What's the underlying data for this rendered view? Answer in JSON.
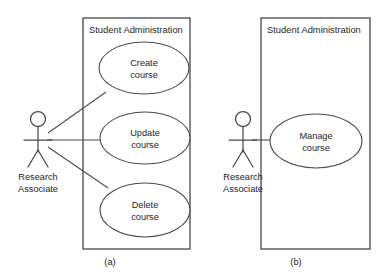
{
  "figure": {
    "type": "uml-use-case-diagram",
    "background_color": "#fefefe",
    "stroke_color": "#4a4a4a",
    "text_color": "#262626"
  },
  "diagram_a": {
    "caption": "(a)",
    "system": {
      "title": "Student Administration",
      "box": {
        "x": 83,
        "y": 18,
        "width": 107,
        "height": 231
      }
    },
    "actor": {
      "name_line1": "Research",
      "name_line2": "Associate",
      "x": 38,
      "y": 112
    },
    "use_cases": [
      {
        "id": "create-course",
        "line1": "Create",
        "line2": "course",
        "cx": 144,
        "cy": 68,
        "rx": 45,
        "ry": 26
      },
      {
        "id": "update-course",
        "line1": "Update",
        "line2": "course",
        "cx": 145,
        "cy": 138,
        "rx": 45,
        "ry": 26
      },
      {
        "id": "delete-course",
        "line1": "Delete",
        "line2": "course",
        "cx": 145,
        "cy": 210,
        "rx": 45,
        "ry": 27
      }
    ],
    "associations": [
      {
        "from": "research-associate",
        "to": "create-course"
      },
      {
        "from": "research-associate",
        "to": "update-course"
      },
      {
        "from": "research-associate",
        "to": "delete-course"
      }
    ]
  },
  "diagram_b": {
    "caption": "(b)",
    "system": {
      "title": "Student Administration",
      "box": {
        "x": 261,
        "y": 18,
        "width": 109,
        "height": 231
      }
    },
    "actor": {
      "name_line1": "Research",
      "name_line2": "Associate",
      "x": 243,
      "y": 112
    },
    "use_cases": [
      {
        "id": "manage-course",
        "line1": "Manage",
        "line2": "course",
        "cx": 316,
        "cy": 141,
        "rx": 46,
        "ry": 27
      }
    ],
    "associations": [
      {
        "from": "research-associate",
        "to": "manage-course"
      }
    ]
  }
}
